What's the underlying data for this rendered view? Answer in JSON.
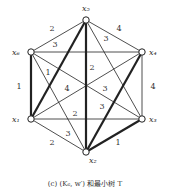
{
  "caption": "(c) (K₆, w′) 和最小树 T",
  "nodes": [
    {
      "id": "x5",
      "label": "x₅",
      "x": 86,
      "y": 20,
      "lx": 82,
      "ly": 11
    },
    {
      "id": "x6",
      "label": "x₆",
      "x": 31,
      "y": 52,
      "lx": 12,
      "ly": 55
    },
    {
      "id": "x4",
      "label": "x₄",
      "x": 142,
      "y": 52,
      "lx": 149,
      "ly": 55
    },
    {
      "id": "x1",
      "label": "x₁",
      "x": 31,
      "y": 119,
      "lx": 12,
      "ly": 122
    },
    {
      "id": "x3",
      "label": "x₃",
      "x": 142,
      "y": 119,
      "lx": 149,
      "ly": 122
    },
    {
      "id": "x2",
      "label": "x₂",
      "x": 86,
      "y": 152,
      "lx": 89,
      "ly": 163
    }
  ],
  "edges": [
    {
      "a": "x5",
      "b": "x6",
      "w": "2",
      "lx": 52,
      "ly": 31,
      "tree": false
    },
    {
      "a": "x6",
      "b": "x4",
      "w": "3",
      "lx": 55,
      "ly": 47,
      "tree": false
    },
    {
      "a": "x5",
      "b": "x4",
      "w": "4",
      "lx": 119,
      "ly": 31,
      "tree": false
    },
    {
      "a": "x5",
      "b": "x3",
      "w": "3",
      "lx": 106,
      "ly": 41,
      "tree": false
    },
    {
      "a": "x6",
      "b": "x1",
      "w": "1",
      "lx": 19,
      "ly": 89,
      "tree": true
    },
    {
      "a": "x4",
      "b": "x3",
      "w": "4",
      "lx": 153,
      "ly": 89,
      "tree": false
    },
    {
      "a": "x5",
      "b": "x1",
      "w": "1",
      "lx": 48,
      "ly": 75,
      "tree": true
    },
    {
      "a": "x5",
      "b": "x2",
      "w": "2",
      "lx": 92,
      "ly": 70,
      "tree": true
    },
    {
      "a": "x1",
      "b": "x4",
      "w": "4",
      "lx": 67,
      "ly": 91,
      "tree": false
    },
    {
      "a": "x6",
      "b": "x3",
      "w": "3",
      "lx": 105,
      "ly": 91,
      "tree": false
    },
    {
      "a": "x4",
      "b": "x2",
      "w": "3",
      "lx": 102,
      "ly": 109,
      "tree": true
    },
    {
      "a": "x1",
      "b": "x3",
      "w": "2",
      "lx": 75,
      "ly": 116,
      "tree": false
    },
    {
      "a": "x6",
      "b": "x2",
      "w": "3",
      "lx": 68,
      "ly": 136,
      "tree": false
    },
    {
      "a": "x1",
      "b": "x2",
      "w": "2",
      "lx": 52,
      "ly": 145,
      "tree": false
    },
    {
      "a": "x2",
      "b": "x3",
      "w": "1",
      "lx": 118,
      "ly": 145,
      "tree": true
    }
  ]
}
